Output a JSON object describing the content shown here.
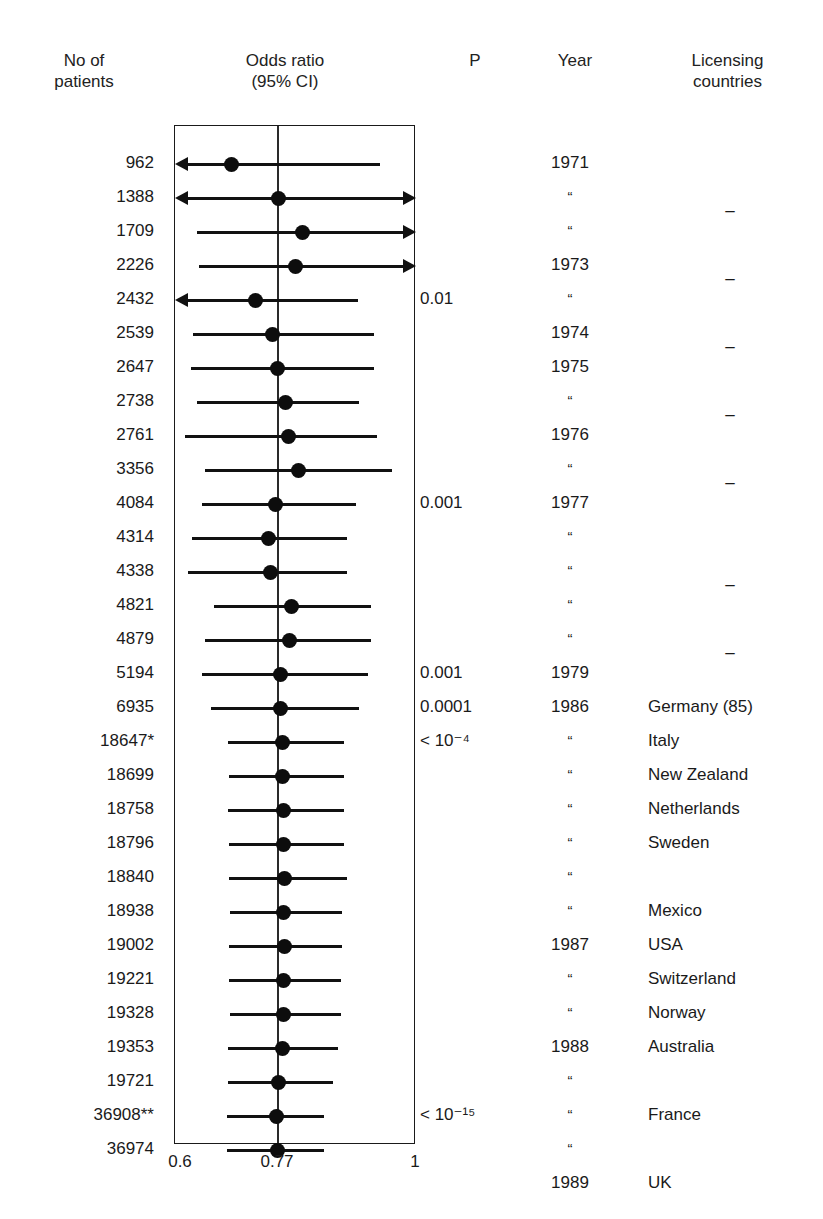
{
  "headers": {
    "patients": "No of\npatients",
    "patients_l1": "No of",
    "patients_l2": "patients",
    "odds_ratio_l1": "Odds ratio",
    "odds_ratio_l2": "(95% CI)",
    "p": "P",
    "year": "Year",
    "licensing_l1": "Licensing",
    "licensing_l2": "countries"
  },
  "axis": {
    "min_label": "0.6",
    "mid_label": "0.77",
    "max_label": "1"
  },
  "chart_data": {
    "type": "forest",
    "title": "Odds ratio (95% CI)",
    "xlabel": "",
    "ylabel": "",
    "xlim": [
      0.6,
      1.0
    ],
    "no_effect_line": 0.77,
    "tick_values": [
      0.6,
      0.77,
      1.0
    ],
    "tick_labels": [
      "0.6",
      "0.77",
      "1"
    ],
    "grid": false,
    "legend": "none",
    "columns": [
      "No of patients",
      "Odds ratio (95% CI)",
      "P",
      "Year",
      "Licensing countries"
    ],
    "rows": [
      {
        "patients": "962",
        "or": 0.694,
        "ci_low": 0.585,
        "ci_high": 0.94,
        "clip_low": true,
        "clip_high": false,
        "p": "",
        "year": "1971",
        "licensing": ""
      },
      {
        "patients": "1388",
        "or": 0.772,
        "ci_low": 0.58,
        "ci_high": 1.01,
        "clip_low": true,
        "clip_high": true,
        "p": "",
        "year": "“",
        "licensing": "–"
      },
      {
        "patients": "1709",
        "or": 0.812,
        "ci_low": 0.636,
        "ci_high": 1.01,
        "clip_low": false,
        "clip_high": true,
        "p": "",
        "year": "“",
        "licensing": ""
      },
      {
        "patients": "2226",
        "or": 0.8,
        "ci_low": 0.64,
        "ci_high": 1.01,
        "clip_low": false,
        "clip_high": true,
        "p": "",
        "year": "1973",
        "licensing": "–"
      },
      {
        "patients": "2432",
        "or": 0.733,
        "ci_low": 0.585,
        "ci_high": 0.903,
        "clip_low": true,
        "clip_high": false,
        "p": "0.01",
        "year": "“",
        "licensing": ""
      },
      {
        "patients": "2539",
        "or": 0.762,
        "ci_low": 0.63,
        "ci_high": 0.93,
        "clip_low": false,
        "clip_high": false,
        "p": "",
        "year": "1974",
        "licensing": "–"
      },
      {
        "patients": "2647",
        "or": 0.77,
        "ci_low": 0.627,
        "ci_high": 0.93,
        "clip_low": false,
        "clip_high": false,
        "p": "",
        "year": "1975",
        "licensing": ""
      },
      {
        "patients": "2738",
        "or": 0.783,
        "ci_low": 0.637,
        "ci_high": 0.905,
        "clip_low": false,
        "clip_high": false,
        "p": "",
        "year": "“",
        "licensing": "–"
      },
      {
        "patients": "2761",
        "or": 0.789,
        "ci_low": 0.617,
        "ci_high": 0.935,
        "clip_low": false,
        "clip_high": false,
        "p": "",
        "year": "1976",
        "licensing": ""
      },
      {
        "patients": "3356",
        "or": 0.805,
        "ci_low": 0.65,
        "ci_high": 0.96,
        "clip_low": false,
        "clip_high": false,
        "p": "",
        "year": "“",
        "licensing": "–"
      },
      {
        "patients": "4084",
        "or": 0.766,
        "ci_low": 0.645,
        "ci_high": 0.9,
        "clip_low": false,
        "clip_high": false,
        "p": "0.001",
        "year": "1977",
        "licensing": ""
      },
      {
        "patients": "4314",
        "or": 0.755,
        "ci_low": 0.628,
        "ci_high": 0.885,
        "clip_low": false,
        "clip_high": false,
        "p": "",
        "year": "“",
        "licensing": ""
      },
      {
        "patients": "4338",
        "or": 0.758,
        "ci_low": 0.622,
        "ci_high": 0.885,
        "clip_low": false,
        "clip_high": false,
        "p": "",
        "year": "“",
        "licensing": "–"
      },
      {
        "patients": "4821",
        "or": 0.793,
        "ci_low": 0.665,
        "ci_high": 0.925,
        "clip_low": false,
        "clip_high": false,
        "p": "",
        "year": "“",
        "licensing": ""
      },
      {
        "patients": "4879",
        "or": 0.79,
        "ci_low": 0.65,
        "ci_high": 0.925,
        "clip_low": false,
        "clip_high": false,
        "p": "",
        "year": "“",
        "licensing": "–"
      },
      {
        "patients": "5194",
        "or": 0.775,
        "ci_low": 0.645,
        "ci_high": 0.92,
        "clip_low": false,
        "clip_high": false,
        "p": "0.001",
        "year": "1979",
        "licensing": ""
      },
      {
        "patients": "6935",
        "or": 0.775,
        "ci_low": 0.66,
        "ci_high": 0.905,
        "clip_low": false,
        "clip_high": false,
        "p": "0.0001",
        "year": "1986",
        "licensing": "Germany (85)"
      },
      {
        "patients": "18647*",
        "or": 0.778,
        "ci_low": 0.688,
        "ci_high": 0.88,
        "clip_low": false,
        "clip_high": false,
        "p": "< 10⁻⁴",
        "year": "“",
        "licensing": "Italy"
      },
      {
        "patients": "18699",
        "or": 0.778,
        "ci_low": 0.69,
        "ci_high": 0.88,
        "clip_low": false,
        "clip_high": false,
        "p": "",
        "year": "“",
        "licensing": "New Zealand"
      },
      {
        "patients": "18758",
        "or": 0.78,
        "ci_low": 0.688,
        "ci_high": 0.88,
        "clip_low": false,
        "clip_high": false,
        "p": "",
        "year": "“",
        "licensing": "Netherlands"
      },
      {
        "patients": "18796",
        "or": 0.78,
        "ci_low": 0.69,
        "ci_high": 0.88,
        "clip_low": false,
        "clip_high": false,
        "p": "",
        "year": "“",
        "licensing": "Sweden"
      },
      {
        "patients": "18840",
        "or": 0.782,
        "ci_low": 0.69,
        "ci_high": 0.885,
        "clip_low": false,
        "clip_high": false,
        "p": "",
        "year": "“",
        "licensing": ""
      },
      {
        "patients": "18938",
        "or": 0.78,
        "ci_low": 0.692,
        "ci_high": 0.878,
        "clip_low": false,
        "clip_high": false,
        "p": "",
        "year": "“",
        "licensing": "Mexico"
      },
      {
        "patients": "19002",
        "or": 0.782,
        "ci_low": 0.69,
        "ci_high": 0.878,
        "clip_low": false,
        "clip_high": false,
        "p": "",
        "year": "1987",
        "licensing": "USA"
      },
      {
        "patients": "19221",
        "or": 0.78,
        "ci_low": 0.69,
        "ci_high": 0.875,
        "clip_low": false,
        "clip_high": false,
        "p": "",
        "year": "“",
        "licensing": "Switzerland"
      },
      {
        "patients": "19328",
        "or": 0.78,
        "ci_low": 0.692,
        "ci_high": 0.875,
        "clip_low": false,
        "clip_high": false,
        "p": "",
        "year": "“",
        "licensing": "Norway"
      },
      {
        "patients": "19353",
        "or": 0.778,
        "ci_low": 0.688,
        "ci_high": 0.87,
        "clip_low": false,
        "clip_high": false,
        "p": "",
        "year": "1988",
        "licensing": "Australia"
      },
      {
        "patients": "19721",
        "or": 0.772,
        "ci_low": 0.688,
        "ci_high": 0.862,
        "clip_low": false,
        "clip_high": false,
        "p": "",
        "year": "“",
        "licensing": ""
      },
      {
        "patients": "36908**",
        "or": 0.768,
        "ci_low": 0.686,
        "ci_high": 0.848,
        "clip_low": false,
        "clip_high": false,
        "p": "< 10⁻¹⁵",
        "year": "“",
        "licensing": "France"
      },
      {
        "patients": "36974",
        "or": 0.77,
        "ci_low": 0.686,
        "ci_high": 0.848,
        "clip_low": false,
        "clip_high": false,
        "p": "",
        "year": "“",
        "licensing": ""
      },
      {
        "patients": "",
        "or": null,
        "ci_low": null,
        "ci_high": null,
        "clip_low": false,
        "clip_high": false,
        "p": "",
        "year": "1989",
        "licensing": "UK"
      }
    ]
  },
  "layout": {
    "plot_left": 174,
    "plot_right": 415,
    "plot_top": 125,
    "row_start": 146,
    "row_step": 34,
    "data_row_count": 30
  },
  "colors": {
    "ink": "#1a1a1a",
    "marker": "#0d0d0d",
    "background": "#ffffff"
  }
}
